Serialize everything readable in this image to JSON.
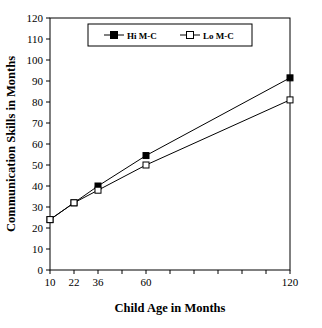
{
  "chart_data": {
    "type": "line",
    "title": "",
    "xlabel": "Child Age in Months",
    "ylabel": "Communication Skills in Months",
    "categories": [
      "10",
      "22",
      "36",
      "60",
      "120"
    ],
    "x_tick_labels": [
      "10",
      "22",
      "36",
      "60",
      "120"
    ],
    "y_tick_labels": [
      "0",
      "10",
      "20",
      "30",
      "40",
      "50",
      "60",
      "70",
      "80",
      "90",
      "100",
      "110",
      "120"
    ],
    "ylim": [
      0,
      120
    ],
    "ystep": 10,
    "grid": false,
    "legend_position": "top-center",
    "series": [
      {
        "name": "Hi M-C",
        "marker": "filled-square",
        "color": "#000000",
        "values": [
          24,
          32,
          40,
          54.5,
          91.5
        ]
      },
      {
        "name": "Lo M-C",
        "marker": "open-square",
        "color": "#000000",
        "values": [
          24,
          32,
          38,
          50,
          81
        ]
      }
    ]
  },
  "legend": {
    "entries": [
      {
        "label": "Hi M-C",
        "marker": "filled-square"
      },
      {
        "label": "Lo M-C",
        "marker": "open-square"
      }
    ]
  },
  "axes": {
    "x_title": "Child Age in Months",
    "y_title": "Communication Skills in Months"
  }
}
